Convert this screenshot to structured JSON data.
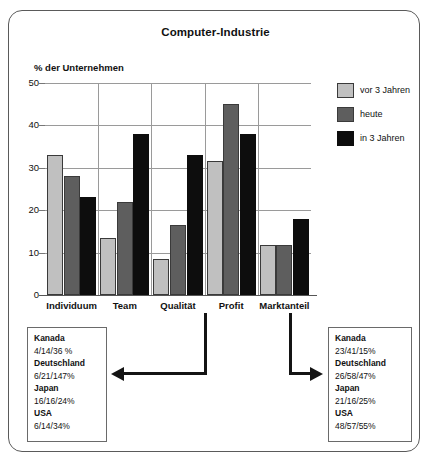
{
  "chart_data": {
    "type": "bar",
    "title": "Computer-Industrie",
    "ylabel": "% der Unternehmen",
    "xlabel": "",
    "ylim": [
      0,
      50
    ],
    "yticks": [
      0,
      10,
      20,
      30,
      40,
      50
    ],
    "grid": true,
    "legend_position": "right",
    "categories": [
      "Individuum",
      "Team",
      "Qualität",
      "Profit",
      "Marktanteil"
    ],
    "series": [
      {
        "name": "vor 3 Jahren",
        "color": "#c0c0c0",
        "values": [
          33,
          13.5,
          8.5,
          31.5,
          11.8
        ]
      },
      {
        "name": "heute",
        "color": "#5e5e5e",
        "values": [
          28,
          22,
          16.5,
          45,
          11.8
        ]
      },
      {
        "name": "in 3 Jahren",
        "color": "#0d0d0d",
        "values": [
          23,
          38,
          33,
          38,
          18
        ]
      }
    ],
    "annotations": [
      {
        "id": "left",
        "points_to": "Qualität",
        "rows": [
          {
            "country": "Kanada",
            "values": "4/14/36 %"
          },
          {
            "country": "Deutschland",
            "values": "6/21/147%"
          },
          {
            "country": "Japan",
            "values": "16/16/24%"
          },
          {
            "country": "USA",
            "values": "6/14/34%"
          }
        ]
      },
      {
        "id": "right",
        "points_to": "Profit",
        "rows": [
          {
            "country": "Kanada",
            "values": "23/41/15%"
          },
          {
            "country": "Deutschland",
            "values": "26/58/47%"
          },
          {
            "country": "Japan",
            "values": "21/16/25%"
          },
          {
            "country": "USA",
            "values": "48/57/55%"
          }
        ]
      }
    ]
  },
  "colors": {
    "series_light": "#c0c0c0",
    "series_mid": "#5e5e5e",
    "series_dark": "#0d0d0d",
    "frame": "#5a5a5a",
    "grid": "#9a9a9a",
    "text": "#111111"
  }
}
